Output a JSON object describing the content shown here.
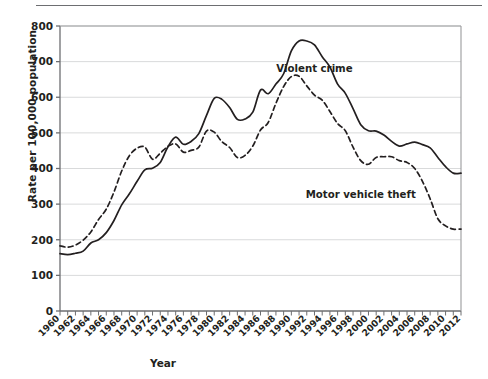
{
  "chart_data": {
    "type": "line",
    "title": "",
    "xlabel": "Year",
    "ylabel": "Rate per 100,000 population",
    "xlim": [
      1960,
      2012
    ],
    "ylim": [
      0,
      800
    ],
    "ytick_step": 100,
    "xtick_step": 1,
    "xtick_label_step": 2,
    "grid": "horizontal",
    "legend_position": "inline-annotation",
    "yticks": [
      "0",
      "100",
      "200",
      "300",
      "400",
      "500",
      "600",
      "700",
      "800"
    ],
    "xticks": [
      "1960",
      "1962",
      "1964",
      "1966",
      "1968",
      "1970",
      "1972",
      "1974",
      "1976",
      "1978",
      "1980",
      "1982",
      "1984",
      "1986",
      "1988",
      "1990",
      "1992",
      "1994",
      "1996",
      "1998",
      "2000",
      "2002",
      "2004",
      "2006",
      "2008",
      "2010",
      "2012"
    ],
    "x": [
      1960,
      1961,
      1962,
      1963,
      1964,
      1965,
      1966,
      1967,
      1968,
      1969,
      1970,
      1971,
      1972,
      1973,
      1974,
      1975,
      1976,
      1977,
      1978,
      1979,
      1980,
      1981,
      1982,
      1983,
      1984,
      1985,
      1986,
      1987,
      1988,
      1989,
      1990,
      1991,
      1992,
      1993,
      1994,
      1995,
      1996,
      1997,
      1998,
      1999,
      2000,
      2001,
      2002,
      2003,
      2004,
      2005,
      2006,
      2007,
      2008,
      2009,
      2010,
      2011,
      2012
    ],
    "series": [
      {
        "name": "Violent crime",
        "style": "solid",
        "color": "#231f20",
        "label_x": 1993,
        "label_y": 672,
        "values": [
          161,
          158,
          162,
          168,
          191,
          200,
          220,
          254,
          298,
          329,
          364,
          396,
          401,
          417,
          461,
          488,
          468,
          476,
          498,
          549,
          597,
          594,
          571,
          538,
          539,
          558,
          620,
          610,
          637,
          666,
          730,
          758,
          758,
          747,
          714,
          685,
          637,
          611,
          568,
          523,
          506,
          505,
          494,
          476,
          463,
          469,
          474,
          467,
          458,
          431,
          405,
          387,
          387
        ]
      },
      {
        "name": "Motor vehicle theft",
        "style": "dashed",
        "color": "#231f20",
        "label_x": 1999,
        "label_y": 318,
        "values": [
          183,
          179,
          185,
          199,
          222,
          257,
          286,
          334,
          393,
          436,
          457,
          460,
          426,
          443,
          462,
          469,
          446,
          451,
          460,
          505,
          502,
          475,
          459,
          431,
          437,
          463,
          508,
          529,
          583,
          630,
          658,
          659,
          632,
          606,
          592,
          560,
          526,
          506,
          460,
          422,
          412,
          431,
          433,
          433,
          422,
          417,
          400,
          364,
          315,
          259,
          239,
          230,
          230
        ]
      }
    ]
  },
  "axes": {
    "y_title": "Rate per 100,000 population",
    "x_title": "Year"
  }
}
